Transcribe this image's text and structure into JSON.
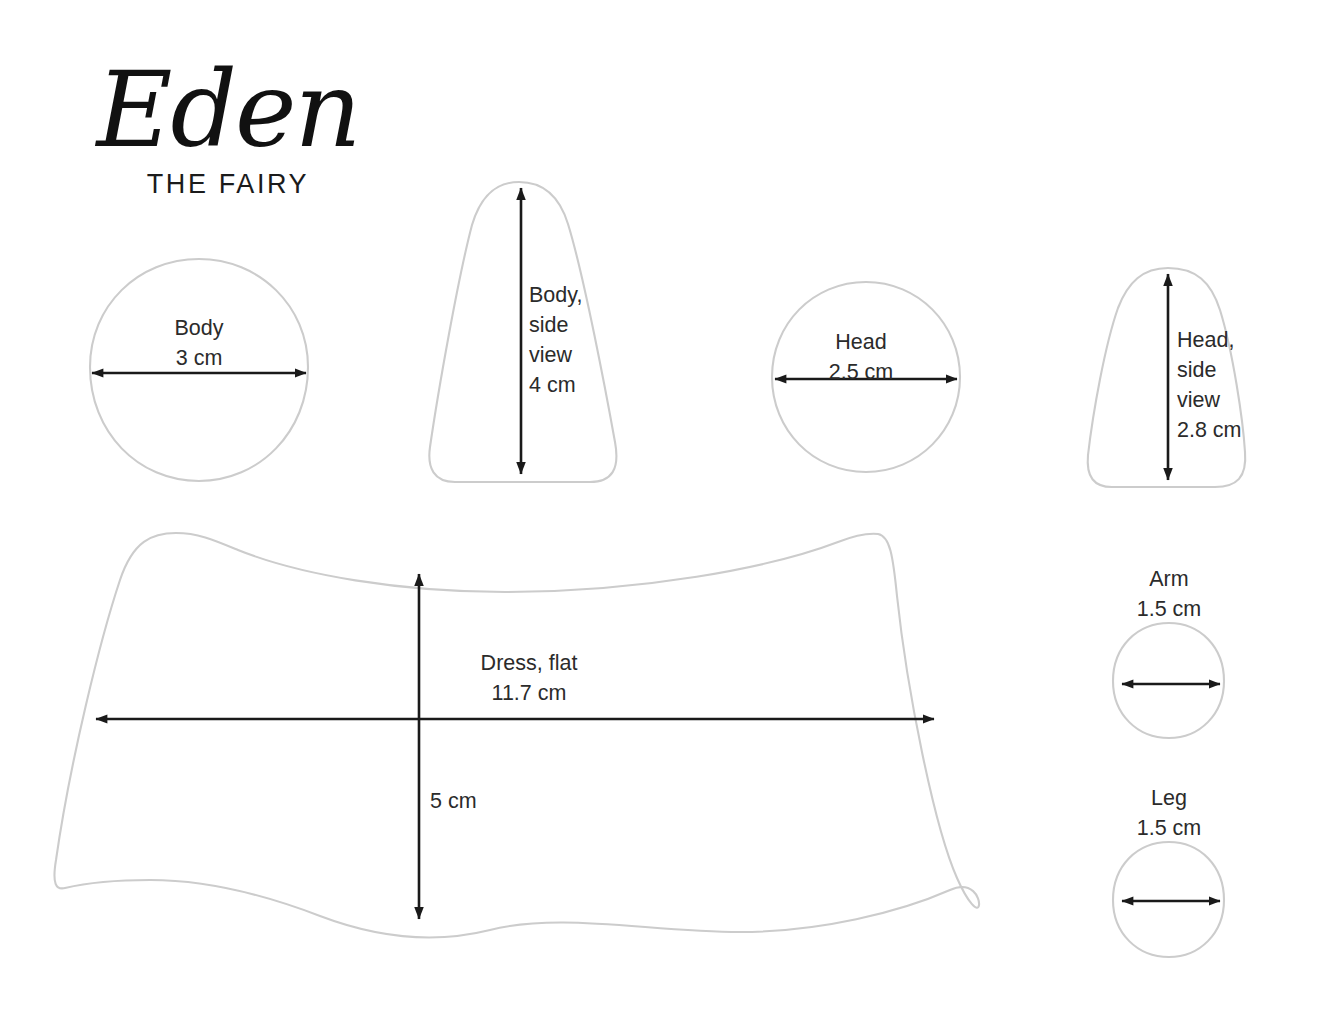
{
  "document": {
    "title_script": "Eden",
    "title_sub": "THE FAIRY",
    "kind": "sewing-pattern-sheet"
  },
  "colors": {
    "outline": "#cccccc",
    "arrow": "#1a1a1a",
    "text": "#2b2b2b",
    "background": "#ffffff"
  },
  "pieces": [
    {
      "id": "body",
      "name": "Body",
      "label": "Body\n3 cm",
      "measure": "3 cm",
      "dimension_label": "Body",
      "arrow": "horizontal",
      "shape": "circle"
    },
    {
      "id": "body-side",
      "name": "Body, side view",
      "label": "Body,\nside\nview\n4 cm",
      "measure": "4 cm",
      "dimension_label": "Body, side view",
      "arrow": "vertical",
      "shape": "bell"
    },
    {
      "id": "head",
      "name": "Head",
      "label": "Head\n2.5 cm",
      "measure": "2.5 cm",
      "dimension_label": "Head",
      "arrow": "horizontal",
      "shape": "circle"
    },
    {
      "id": "head-side",
      "name": "Head, side view",
      "label": "Head,\nside\nview\n2.8 cm",
      "measure": "2.8 cm",
      "dimension_label": "Head, side view",
      "arrow": "vertical",
      "shape": "dome"
    },
    {
      "id": "dress",
      "name": "Dress, flat",
      "label": "Dress, flat\n11.7 cm",
      "measure_width": "11.7 cm",
      "measure_height": "5 cm",
      "height_label": "5 cm",
      "dimension_label": "Dress, flat",
      "arrow": "both",
      "shape": "skirt"
    },
    {
      "id": "arm",
      "name": "Arm",
      "label": "Arm\n1.5 cm",
      "measure": "1.5 cm",
      "dimension_label": "Arm",
      "arrow": "horizontal",
      "shape": "circle"
    },
    {
      "id": "leg",
      "name": "Leg",
      "label": "Leg\n1.5 cm",
      "measure": "1.5 cm",
      "dimension_label": "Leg",
      "arrow": "horizontal",
      "shape": "circle"
    }
  ]
}
